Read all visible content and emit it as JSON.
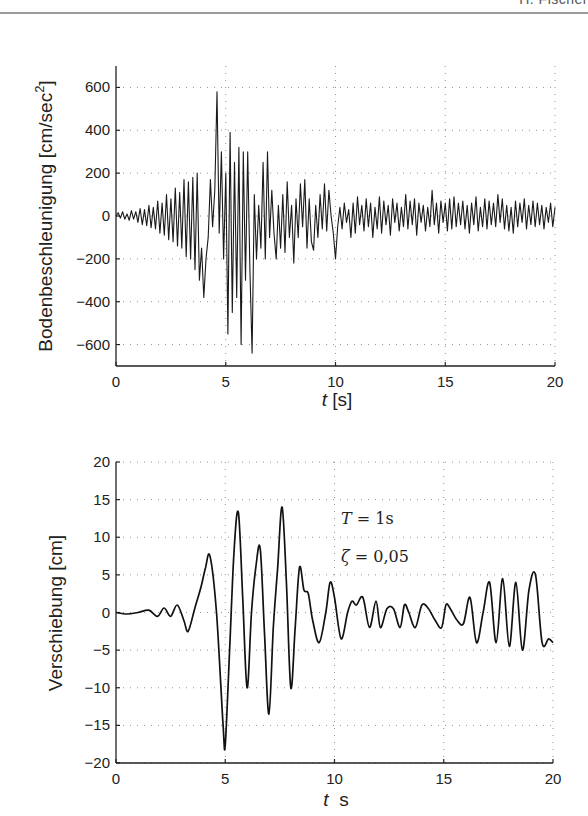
{
  "header": {
    "running_head": "H. Fischer"
  },
  "chart_data": [
    {
      "type": "line",
      "title": "",
      "xlabel_italic": "t",
      "xlabel_unit": " [s]",
      "ylabel": "Bodenbeschleunigung [cm/sec",
      "ylabel_sup": "2",
      "ylabel_close": "]",
      "xlim": [
        0,
        20
      ],
      "ylim": [
        -700,
        700
      ],
      "xticks": [
        0,
        5,
        10,
        15,
        20
      ],
      "yticks": [
        -600,
        -400,
        -200,
        0,
        200,
        400,
        600
      ],
      "xtick_labels": [
        "0",
        "5",
        "10",
        "15",
        "20"
      ],
      "ytick_labels": [
        "−600",
        "−400",
        "−200",
        "0",
        "200",
        "400",
        "600"
      ],
      "grid": true,
      "grid_style": "dotted",
      "legend": null,
      "series": [
        {
          "name": "ground acceleration",
          "x": [
            0,
            0.1,
            0.2,
            0.3,
            0.4,
            0.5,
            0.6,
            0.7,
            0.8,
            0.9,
            1.0,
            1.1,
            1.2,
            1.3,
            1.4,
            1.5,
            1.6,
            1.7,
            1.8,
            1.9,
            2.0,
            2.1,
            2.2,
            2.3,
            2.4,
            2.5,
            2.6,
            2.7,
            2.8,
            2.9,
            3.0,
            3.1,
            3.2,
            3.3,
            3.4,
            3.5,
            3.6,
            3.7,
            3.8,
            3.9,
            4.0,
            4.1,
            4.2,
            4.3,
            4.4,
            4.5,
            4.6,
            4.7,
            4.8,
            4.9,
            5.0,
            5.1,
            5.2,
            5.3,
            5.4,
            5.5,
            5.6,
            5.7,
            5.8,
            5.9,
            6.0,
            6.1,
            6.2,
            6.3,
            6.4,
            6.5,
            6.6,
            6.7,
            6.8,
            6.9,
            7.0,
            7.1,
            7.2,
            7.3,
            7.4,
            7.5,
            7.6,
            7.7,
            7.8,
            7.9,
            8.0,
            8.1,
            8.2,
            8.3,
            8.4,
            8.5,
            8.6,
            8.7,
            8.8,
            8.9,
            9.0,
            9.1,
            9.2,
            9.3,
            9.4,
            9.5,
            9.6,
            9.7,
            9.8,
            9.9,
            10.0,
            10.1,
            10.2,
            10.3,
            10.4,
            10.5,
            10.6,
            10.7,
            10.8,
            10.9,
            11.0,
            11.1,
            11.2,
            11.3,
            11.4,
            11.5,
            11.6,
            11.7,
            11.8,
            11.9,
            12.0,
            12.1,
            12.2,
            12.3,
            12.4,
            12.5,
            12.6,
            12.7,
            12.8,
            12.9,
            13.0,
            13.1,
            13.2,
            13.3,
            13.4,
            13.5,
            13.6,
            13.7,
            13.8,
            13.9,
            14.0,
            14.1,
            14.2,
            14.3,
            14.4,
            14.5,
            14.6,
            14.7,
            14.8,
            14.9,
            15.0,
            15.1,
            15.2,
            15.3,
            15.4,
            15.5,
            15.6,
            15.7,
            15.8,
            15.9,
            16.0,
            16.1,
            16.2,
            16.3,
            16.4,
            16.5,
            16.6,
            16.7,
            16.8,
            16.9,
            17.0,
            17.1,
            17.2,
            17.3,
            17.4,
            17.5,
            17.6,
            17.7,
            17.8,
            17.9,
            18.0,
            18.1,
            18.2,
            18.3,
            18.4,
            18.5,
            18.6,
            18.7,
            18.8,
            18.9,
            19.0,
            19.1,
            19.2,
            19.3,
            19.4,
            19.5,
            19.6,
            19.7,
            19.8,
            19.9,
            20.0
          ],
          "y": [
            0,
            15,
            -10,
            20,
            -15,
            10,
            -20,
            25,
            -15,
            20,
            -30,
            35,
            -40,
            30,
            -45,
            50,
            -55,
            40,
            -60,
            70,
            -80,
            60,
            -90,
            100,
            -110,
            80,
            -120,
            130,
            -140,
            110,
            -150,
            170,
            -190,
            160,
            -200,
            180,
            -250,
            200,
            -300,
            -150,
            -380,
            -200,
            -100,
            170,
            -50,
            120,
            580,
            -80,
            300,
            -200,
            200,
            -550,
            390,
            -450,
            250,
            -380,
            320,
            -600,
            300,
            -300,
            300,
            -250,
            -640,
            100,
            -200,
            50,
            -150,
            250,
            -200,
            300,
            -100,
            120,
            -80,
            -200,
            50,
            -150,
            100,
            -170,
            160,
            -100,
            50,
            -220,
            80,
            -100,
            150,
            -50,
            170,
            -150,
            80,
            -120,
            -160,
            50,
            -100,
            100,
            -60,
            150,
            -70,
            120,
            0,
            -80,
            -200,
            -50,
            40,
            -60,
            60,
            -30,
            30,
            -100,
            60,
            -80,
            90,
            -40,
            50,
            -70,
            80,
            -50,
            60,
            -100,
            40,
            -60,
            90,
            -80,
            70,
            -40,
            50,
            -90,
            80,
            -30,
            60,
            -70,
            40,
            -50,
            100,
            -60,
            70,
            -40,
            80,
            -90,
            60,
            -30,
            50,
            -70,
            40,
            -50,
            120,
            -40,
            60,
            -80,
            70,
            -30,
            60,
            -70,
            80,
            -60,
            90,
            -50,
            60,
            -40,
            70,
            -60,
            50,
            -80,
            60,
            -40,
            90,
            -70,
            40,
            -50,
            80,
            -60,
            70,
            -40,
            60,
            -50,
            100,
            -30,
            80,
            -60,
            50,
            -70,
            40,
            -80,
            70,
            -50,
            60,
            -30,
            80,
            -60,
            50,
            -40,
            70,
            -50,
            60,
            -40,
            50,
            -60,
            40,
            -30,
            60,
            -50,
            40
          ]
        }
      ]
    },
    {
      "type": "line",
      "title": "",
      "xlabel_italic": "t",
      "xlabel_unit": "  s",
      "ylabel": "Verschiebung [cm]",
      "xlim": [
        0,
        20
      ],
      "ylim": [
        -20,
        20
      ],
      "xticks": [
        0,
        5,
        10,
        15,
        20
      ],
      "yticks": [
        -20,
        -15,
        -10,
        -5,
        0,
        5,
        10,
        15,
        20
      ],
      "xtick_labels": [
        "0",
        "5",
        "10",
        "15",
        "20"
      ],
      "ytick_labels": [
        "−20",
        "−15",
        "−10",
        "−5",
        "0",
        "5",
        "10",
        "15",
        "20"
      ],
      "grid": true,
      "grid_style": "dotted",
      "legend": null,
      "annotations": [
        {
          "text_var": "T",
          "text_rest": " = 1s",
          "x": 10.3,
          "y": 12.5
        },
        {
          "text_var": "ζ",
          "text_rest": " = 0,05",
          "x": 10.3,
          "y": 7.5
        }
      ],
      "series": [
        {
          "name": "displacement response (T = 1 s, ζ = 0.05)",
          "x": [
            0,
            0.5,
            1.0,
            1.5,
            1.9,
            2.2,
            2.5,
            2.8,
            3.1,
            3.3,
            3.6,
            3.9,
            4.1,
            4.3,
            4.6,
            4.9,
            5.0,
            5.2,
            5.4,
            5.6,
            5.8,
            6.0,
            6.2,
            6.4,
            6.6,
            6.8,
            7.0,
            7.2,
            7.4,
            7.6,
            7.8,
            8.0,
            8.2,
            8.4,
            8.6,
            8.8,
            9.0,
            9.3,
            9.6,
            9.8,
            10.0,
            10.3,
            10.6,
            10.8,
            11.0,
            11.3,
            11.6,
            11.9,
            12.1,
            12.4,
            12.7,
            13.0,
            13.2,
            13.4,
            13.7,
            14.0,
            14.3,
            14.6,
            14.9,
            15.1,
            15.3,
            15.6,
            15.9,
            16.2,
            16.5,
            16.8,
            17.1,
            17.4,
            17.7,
            18.0,
            18.3,
            18.6,
            18.9,
            19.2,
            19.5,
            19.8,
            20.0
          ],
          "y": [
            0,
            -0.2,
            0,
            0.3,
            -0.5,
            0.6,
            -0.5,
            1.0,
            -1.0,
            -2.5,
            0.5,
            3.5,
            6.0,
            7.5,
            0,
            -15,
            -17.5,
            -5,
            8,
            13.3,
            2,
            -10,
            0,
            6,
            8.5,
            -3,
            -13.5,
            -2,
            6,
            14,
            4,
            -10,
            -2,
            6,
            3,
            2.5,
            -1,
            -4,
            0,
            4,
            2,
            -3.5,
            0,
            1.5,
            1,
            2,
            -2,
            1.5,
            -2,
            0.5,
            0.5,
            -2,
            1,
            0,
            -2,
            1,
            0.5,
            -1,
            -2,
            1,
            0.5,
            -1,
            -1.5,
            2,
            -4,
            0,
            4,
            -4,
            4.5,
            -4.5,
            4,
            -5,
            3,
            5,
            -4,
            -3.5,
            -4
          ]
        }
      ]
    }
  ]
}
